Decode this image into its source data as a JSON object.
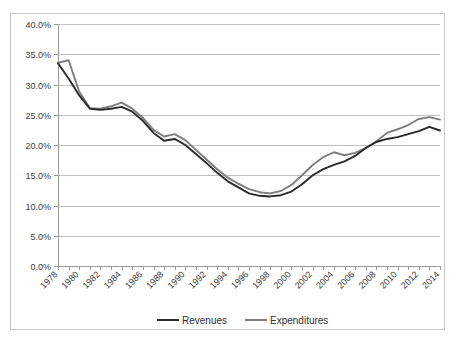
{
  "chart_data": {
    "type": "line",
    "title": "",
    "xlabel": "",
    "ylabel": "",
    "ylim": [
      0,
      40
    ],
    "ytick_step": 5,
    "ytick_labels": [
      "0.0%",
      "5.0%",
      "10.0%",
      "15.0%",
      "20.0%",
      "25.0%",
      "30.0%",
      "35.0%",
      "40.0%"
    ],
    "ytick_values": [
      0,
      5,
      10,
      15,
      20,
      25,
      30,
      35,
      40
    ],
    "grid": true,
    "grid_axis": "y",
    "legend_position": "bottom",
    "x": [
      1978,
      1979,
      1980,
      1981,
      1982,
      1983,
      1984,
      1985,
      1986,
      1987,
      1988,
      1989,
      1990,
      1991,
      1992,
      1993,
      1994,
      1995,
      1996,
      1997,
      1998,
      1999,
      2000,
      2001,
      2002,
      2003,
      2004,
      2005,
      2006,
      2007,
      2008,
      2009,
      2010,
      2011,
      2012,
      2013,
      2014
    ],
    "xtick_labels": [
      "1978",
      "1980",
      "1982",
      "1984",
      "1986",
      "1988",
      "1990",
      "1992",
      "1994",
      "1996",
      "1998",
      "2000",
      "2002",
      "2004",
      "2006",
      "2008",
      "2010",
      "2012",
      "2014"
    ],
    "xtick_values": [
      1978,
      1980,
      1982,
      1984,
      1986,
      1988,
      1990,
      1992,
      1994,
      1996,
      1998,
      2000,
      2002,
      2004,
      2006,
      2008,
      2010,
      2012,
      2014
    ],
    "xlim": [
      1978,
      2014
    ],
    "series": [
      {
        "name": "Revenues",
        "color": "#2b2b2b",
        "values": [
          33.5,
          31.0,
          28.2,
          26.0,
          25.8,
          26.0,
          26.3,
          25.5,
          24.0,
          22.0,
          20.7,
          21.0,
          20.0,
          18.5,
          17.0,
          15.4,
          14.0,
          13.0,
          12.0,
          11.6,
          11.5,
          11.7,
          12.3,
          13.5,
          15.0,
          16.0,
          16.7,
          17.3,
          18.2,
          19.5,
          20.5,
          21.0,
          21.3,
          21.8,
          22.3,
          23.0,
          22.4
        ]
      },
      {
        "name": "Expenditures",
        "color": "#7d7d7d",
        "values": [
          33.6,
          34.0,
          28.8,
          26.1,
          26.0,
          26.4,
          27.0,
          26.0,
          24.5,
          22.5,
          21.4,
          21.8,
          20.8,
          19.2,
          17.6,
          16.0,
          14.6,
          13.6,
          12.7,
          12.2,
          12.0,
          12.4,
          13.4,
          15.0,
          16.7,
          18.0,
          18.8,
          18.3,
          18.7,
          19.5,
          20.6,
          22.0,
          22.6,
          23.3,
          24.3,
          24.6,
          24.2
        ]
      }
    ]
  },
  "legend": {
    "items": [
      {
        "label": "Revenues",
        "color": "#2b2b2b"
      },
      {
        "label": "Expenditures",
        "color": "#7d7d7d"
      }
    ]
  }
}
